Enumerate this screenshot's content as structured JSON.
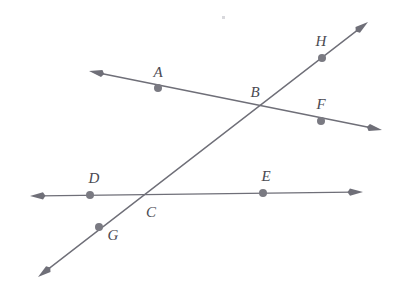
{
  "figure": {
    "width": 407,
    "height": 286,
    "background_color": "#ffffff",
    "stroke_color": "#6f6f78",
    "dot_color": "#7a7a82",
    "label_color": "#4a4a52",
    "stroke_width": 1.4,
    "dot_radius": 4
  },
  "labels": [
    {
      "id": "A",
      "text": "A",
      "x": 158,
      "y": 72
    },
    {
      "id": "B",
      "text": "B",
      "x": 255,
      "y": 92
    },
    {
      "id": "C",
      "text": "C",
      "x": 151,
      "y": 212
    },
    {
      "id": "D",
      "text": "D",
      "x": 94,
      "y": 178
    },
    {
      "id": "E",
      "text": "E",
      "x": 266,
      "y": 176
    },
    {
      "id": "F",
      "text": "F",
      "x": 321,
      "y": 104
    },
    {
      "id": "G",
      "text": "G",
      "x": 113,
      "y": 235
    },
    {
      "id": "H",
      "text": "H",
      "x": 321,
      "y": 41
    }
  ],
  "points": [
    {
      "id": "A",
      "x": 158,
      "y": 88,
      "on_lines": [
        "AF"
      ],
      "marked": true
    },
    {
      "id": "B",
      "x": 259,
      "y": 104,
      "on_lines": [
        "AF",
        "GH"
      ],
      "marked": false
    },
    {
      "id": "C",
      "x": 146,
      "y": 193,
      "on_lines": [
        "DE",
        "GH"
      ],
      "marked": false
    },
    {
      "id": "D",
      "x": 90,
      "y": 195,
      "on_lines": [
        "DE"
      ],
      "marked": true
    },
    {
      "id": "E",
      "x": 263,
      "y": 193,
      "on_lines": [
        "DE"
      ],
      "marked": true
    },
    {
      "id": "F",
      "x": 321,
      "y": 121,
      "on_lines": [
        "AF"
      ],
      "marked": true
    },
    {
      "id": "G",
      "x": 99,
      "y": 227,
      "on_lines": [
        "GH"
      ],
      "marked": true
    },
    {
      "id": "H",
      "x": 322,
      "y": 58,
      "on_lines": [
        "GH"
      ],
      "marked": true
    }
  ],
  "lines": [
    {
      "id": "AF",
      "name": "line-af",
      "through_points": [
        "A",
        "B",
        "F"
      ],
      "x1": 89,
      "y1": 71,
      "x2": 382,
      "y2": 130,
      "arrow_start": true,
      "arrow_end": true
    },
    {
      "id": "DE",
      "name": "line-de",
      "through_points": [
        "D",
        "C",
        "E"
      ],
      "x1": 30,
      "y1": 196,
      "x2": 363,
      "y2": 192,
      "arrow_start": true,
      "arrow_end": true
    },
    {
      "id": "GH",
      "name": "line-gh",
      "through_points": [
        "G",
        "C",
        "B",
        "H"
      ],
      "x1": 38,
      "y1": 277,
      "x2": 368,
      "y2": 22,
      "arrow_start": true,
      "arrow_end": true
    }
  ],
  "artifacts": [
    {
      "id": "speck",
      "x": 222,
      "y": 16,
      "size": 3
    }
  ]
}
